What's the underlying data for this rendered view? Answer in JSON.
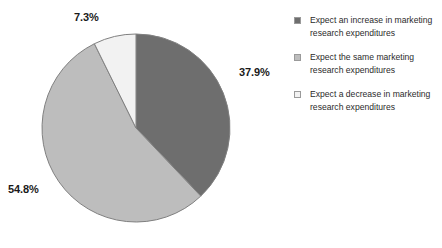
{
  "chart_data": {
    "type": "pie",
    "title": "",
    "subtitle": "",
    "xlabel": "",
    "ylabel": "",
    "grid": false,
    "legend_position": "right",
    "start_angle_deg": 0,
    "direction": "clockwise",
    "categories": [
      "Expect an increase in marketing research expenditures",
      "Expect the same marketing research expenditures",
      "Expect a decrease in marketing research expenditures"
    ],
    "values": [
      37.9,
      54.8,
      7.3
    ],
    "value_unit": "%",
    "data_labels": [
      "37.9%",
      "54.8%",
      "7.3%"
    ],
    "colors": [
      "#6e6e6e",
      "#bdbdbd",
      "#f2f2f2"
    ],
    "slice_border_color": "#808080"
  },
  "pie": {
    "center_x": 136,
    "center_y": 128,
    "radius": 94,
    "slices": [
      {
        "id": "increase",
        "label": "37.9%",
        "value": 37.9,
        "color": "#6e6e6e"
      },
      {
        "id": "same",
        "label": "54.8%",
        "value": 54.8,
        "color": "#bdbdbd"
      },
      {
        "id": "decrease",
        "label": "7.3%",
        "value": 7.3,
        "color": "#f2f2f2"
      }
    ],
    "labels": {
      "top": "7.3%",
      "right": "37.9%",
      "left": "54.8%"
    }
  },
  "legend": {
    "items": [
      {
        "swatch_color": "#6e6e6e",
        "line1": "Expect an increase in marketing",
        "line2": "research expenditures"
      },
      {
        "swatch_color": "#bdbdbd",
        "line1": "Expect the same marketing",
        "line2": "research expenditures"
      },
      {
        "swatch_color": "#f2f2f2",
        "line1": "Expect a decrease in marketing",
        "line2": "research expenditures"
      }
    ]
  }
}
